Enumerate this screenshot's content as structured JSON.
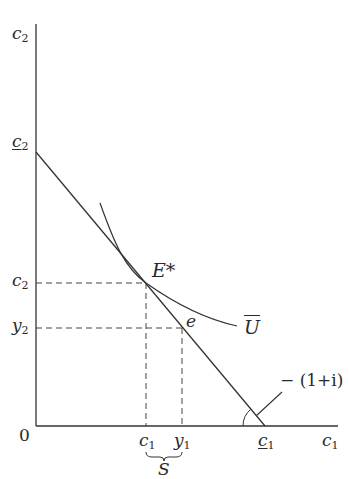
{
  "diagram": {
    "type": "intertemporal consumption choice",
    "axes": {
      "y_label": {
        "base": "c",
        "sub": "2"
      },
      "x_label": {
        "base": "c",
        "sub": "1"
      },
      "origin": "0"
    },
    "ticks": {
      "y_intercept": {
        "base": "c",
        "sub": "2",
        "underline": true
      },
      "c2": {
        "base": "c",
        "sub": "2"
      },
      "y2": {
        "base": "y",
        "sub": "2"
      },
      "c1": {
        "base": "c",
        "sub": "1"
      },
      "y1": {
        "base": "y",
        "sub": "1"
      },
      "x_intercept": {
        "base": "c",
        "sub": "1",
        "underline": true
      }
    },
    "points": {
      "optimum": "E*",
      "endowment": "e"
    },
    "curves": {
      "indifference": "U",
      "slope_label": "− (1+i)"
    },
    "brace_label": "S",
    "colors": {
      "line": "#333333",
      "text": "#2a2a2a",
      "background": "#ffffff"
    }
  }
}
